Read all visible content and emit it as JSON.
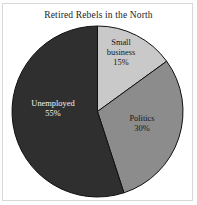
{
  "chart_data": {
    "type": "pie",
    "title": "Retired Rebels in the North",
    "xlabel": "",
    "ylabel": "",
    "legend": "none",
    "grid": false,
    "start_angle_deg": 0,
    "direction": "clockwise",
    "categories": [
      "Small business",
      "Politics",
      "Unemployed"
    ],
    "values": [
      15,
      30,
      55
    ],
    "value_suffix": "%",
    "slices": [
      {
        "label": "Small business",
        "label_line1": "Small",
        "label_line2": "business",
        "value": 15,
        "value_text": "15%",
        "color": "#c9c9c9",
        "text_color": "#141414"
      },
      {
        "label": "Politics",
        "label_line1": "Politics",
        "label_line2": "",
        "value": 30,
        "value_text": "30%",
        "color": "#8c8c8c",
        "text_color": "#141414"
      },
      {
        "label": "Unemployed",
        "label_line1": "Unemployed",
        "label_line2": "",
        "value": 55,
        "value_text": "55%",
        "color": "#2f2f2f",
        "text_color": "#f2f2f2"
      }
    ]
  },
  "figure": {
    "background": "#ffffff",
    "border_color": "#d8d8d8",
    "slice_outline_color": "#111111"
  }
}
